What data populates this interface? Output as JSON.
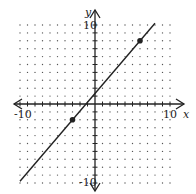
{
  "chart_data": {
    "type": "line",
    "title": "",
    "xlabel": "x",
    "ylabel": "y",
    "xlim": [
      -10,
      10
    ],
    "ylim": [
      -10,
      10
    ],
    "grid": "dotted",
    "x_tick_labels": [
      "-10",
      "10"
    ],
    "y_tick_labels": [
      "10",
      "-10"
    ],
    "series": [
      {
        "name": "line",
        "points": [
          [
            -3,
            -2
          ],
          [
            6,
            8
          ]
        ],
        "slope": 1.111,
        "intercept": 1.333,
        "extent_x": [
          -10,
          8
        ]
      }
    ],
    "marked_points": [
      [
        -3,
        -2
      ],
      [
        6,
        8
      ]
    ]
  },
  "labels": {
    "x_axis": "x",
    "y_axis": "y",
    "x_min": "-10",
    "x_max": "10",
    "y_max": "10",
    "y_min": "-10"
  },
  "colors": {
    "line": "#222222",
    "grid_dot": "#555555"
  }
}
